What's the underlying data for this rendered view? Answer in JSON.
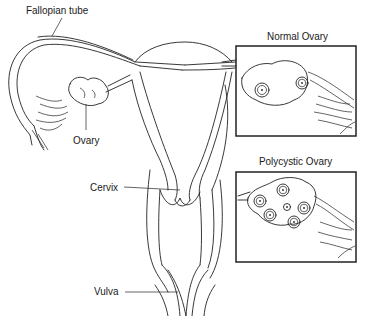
{
  "diagram": {
    "type": "anatomical illustration",
    "labels": {
      "fallopian_tube": "Fallopian tube",
      "ovary": "Ovary",
      "cervix": "Cervix",
      "vulva": "Vulva"
    },
    "insets": [
      {
        "title": "Normal Ovary",
        "follicle_count": 2
      },
      {
        "title": "Polycystic Ovary",
        "follicle_count": 6
      }
    ],
    "colors": {
      "line": "#222222",
      "background": "#ffffff"
    }
  }
}
